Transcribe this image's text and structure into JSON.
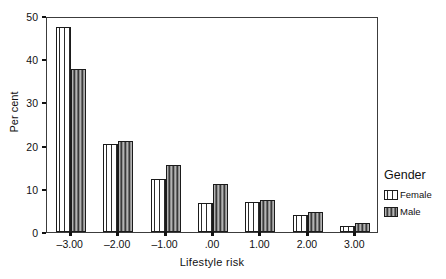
{
  "chart_data": {
    "type": "bar",
    "title": "",
    "xlabel": "Lifestyle risk",
    "ylabel": "Per cent",
    "categories": [
      "-3.00",
      "-2.00",
      "-1.00",
      ".00",
      "1.00",
      "2.00",
      "3.00"
    ],
    "xtick_labels": [
      "–3.00",
      "–2.00",
      "–1.00",
      ".00",
      "1.00",
      "2.00",
      "3.00"
    ],
    "series": [
      {
        "name": "Female",
        "values": [
          47.5,
          20.3,
          12.3,
          6.7,
          7.0,
          4.0,
          1.3
        ]
      },
      {
        "name": "Male",
        "values": [
          37.8,
          21.0,
          15.4,
          11.1,
          7.4,
          4.6,
          2.2
        ]
      }
    ],
    "ylim": [
      0,
      50
    ],
    "yticks": [
      0,
      10,
      20,
      30,
      40,
      50
    ],
    "ytick_labels": [
      "0",
      "10",
      "20",
      "30",
      "40",
      "50"
    ],
    "grid": false,
    "legend": {
      "title": "Gender",
      "position": "right",
      "entries": [
        "Female",
        "Male"
      ]
    }
  },
  "legend": {
    "title": "Gender",
    "items": [
      {
        "label": "Female",
        "swatch": "female-striped-swatch"
      },
      {
        "label": "Male",
        "swatch": "male-striped-swatch"
      }
    ]
  },
  "axes": {
    "y_title": "Per cent",
    "x_title": "Lifestyle risk"
  }
}
